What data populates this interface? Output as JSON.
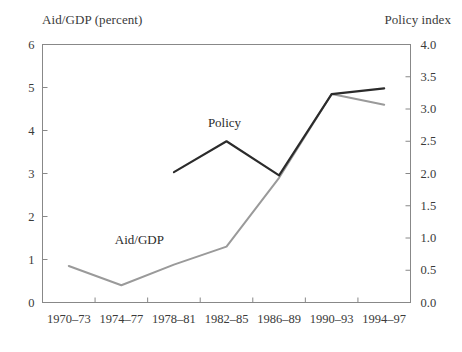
{
  "chart_data": {
    "type": "line",
    "title": "",
    "categories": [
      "1970–73",
      "1974–77",
      "1978–81",
      "1982–85",
      "1986–89",
      "1990–93",
      "1994–97"
    ],
    "xlabel": "",
    "grid": false,
    "legend_position": "inline-annotations",
    "axes": {
      "left": {
        "label": "Aid/GDP (percent)",
        "ylim": [
          0,
          6
        ],
        "ticks": [
          0,
          1,
          2,
          3,
          4,
          5,
          6
        ],
        "tick_labels": [
          "0",
          "1",
          "2",
          "3",
          "4",
          "5",
          "6"
        ]
      },
      "right": {
        "label": "Policy index",
        "ylim": [
          0,
          4
        ],
        "ticks": [
          0,
          0.5,
          1,
          1.5,
          2,
          2.5,
          3,
          3.5,
          4
        ],
        "tick_labels": [
          "0.0",
          "0.5",
          "1.0",
          "1.5",
          "2.0",
          "2.5",
          "3.0",
          "3.5",
          "4.0"
        ]
      }
    },
    "series": [
      {
        "name": "Aid/GDP",
        "axis": "left",
        "color": "#9a9a9a",
        "annotation": "Aid/GDP",
        "values": [
          0.85,
          0.4,
          0.88,
          1.3,
          2.9,
          4.85,
          4.6
        ]
      },
      {
        "name": "Policy",
        "axis": "right",
        "color": "#2b2b2b",
        "annotation": "Policy",
        "values": [
          null,
          null,
          2.02,
          2.5,
          1.97,
          3.23,
          3.32
        ]
      }
    ]
  },
  "annotations": {
    "aid_gdp_label": "Aid/GDP",
    "policy_label": "Policy"
  }
}
